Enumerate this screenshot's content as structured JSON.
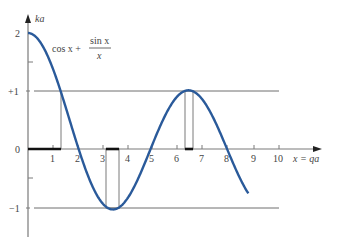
{
  "chart_data": {
    "type": "line",
    "title": "",
    "xlabel": "x = qa",
    "ylabel": "ka",
    "xlim": [
      0,
      10
    ],
    "ylim": [
      -1,
      2
    ],
    "x_ticks": [
      "1",
      "2",
      "3",
      "4",
      "5",
      "6",
      "7",
      "8",
      "9",
      "10"
    ],
    "y_ticks": [
      "2",
      "+1",
      "0",
      "−1"
    ],
    "grid": false,
    "legend": null,
    "series": [
      {
        "name": "cos x + sin x / x",
        "function": "cos(x) + sin(x)/x",
        "x_range": [
          0,
          8.83
        ],
        "color": "#2a5a9a",
        "sample_points": [
          {
            "x": 0,
            "y": 2.0
          },
          {
            "x": 1,
            "y": 1.38
          },
          {
            "x": 1.33,
            "y": 1.0
          },
          {
            "x": 2,
            "y": 0.04
          },
          {
            "x": 3,
            "y": -0.94
          },
          {
            "x": 3.5,
            "y": -1.04
          },
          {
            "x": 4,
            "y": -0.84
          },
          {
            "x": 5,
            "y": 0.09
          },
          {
            "x": 6,
            "y": 0.91
          },
          {
            "x": 6.5,
            "y": 1.01
          },
          {
            "x": 7,
            "y": 0.85
          },
          {
            "x": 8,
            "y": -0.02
          },
          {
            "x": 8.83,
            "y": -0.74
          }
        ]
      }
    ],
    "reference_lines": [
      {
        "y": 1,
        "label": "+1"
      },
      {
        "y": -1,
        "label": "−1"
      }
    ],
    "allowed_bands": [
      [
        0,
        1.33
      ],
      [
        3.14,
        3.67
      ],
      [
        6.33,
        6.65
      ]
    ],
    "annotations": [
      {
        "text": "cos x + sin x / x",
        "position": "upper-left near curve"
      }
    ]
  },
  "labels": {
    "ylabel": "ka",
    "xlabel": "x = qa",
    "y2": "2",
    "yp1": "+1",
    "y0": "0",
    "ym1": "−1",
    "formula_cos": "cos x +",
    "formula_num": "sin x",
    "formula_den": "x",
    "xt1": "1",
    "xt2": "2",
    "xt3": "3",
    "xt4": "4",
    "xt5": "5",
    "xt6": "6",
    "xt7": "7",
    "xt8": "8",
    "xt9": "9",
    "xt10": "10"
  }
}
